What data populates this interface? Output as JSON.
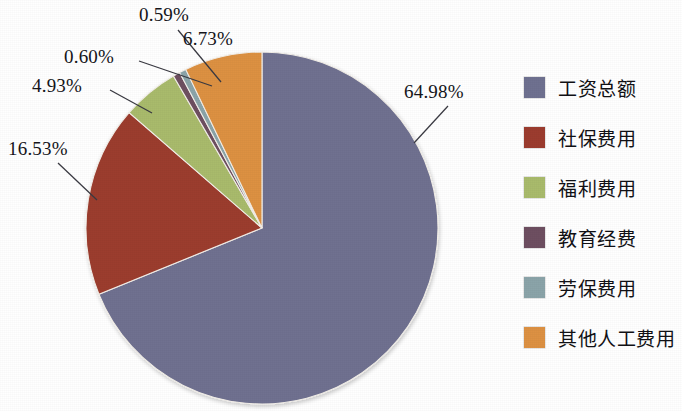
{
  "chart_data": {
    "type": "pie",
    "title": "",
    "labels": [
      "工资总额",
      "社保费用",
      "福利费用",
      "教育经费",
      "劳保费用",
      "其他人工费用"
    ],
    "values": [
      64.98,
      16.53,
      4.93,
      0.6,
      0.59,
      6.73
    ],
    "value_labels": [
      "64.98%",
      "16.53%",
      "4.93%",
      "0.60%",
      "0.59%",
      "6.73%"
    ],
    "colors": [
      "#6f7190",
      "#9c3c2f",
      "#a9bb6c",
      "#6e4f61",
      "#8ba4a9",
      "#dd9143"
    ],
    "legend_position": "right",
    "start_angle_deg": 0,
    "direction": "clockwise",
    "units": "percent",
    "grid": false
  },
  "legend": {
    "items": [
      {
        "label": "工资总额",
        "color": "#6f7190"
      },
      {
        "label": "社保费用",
        "color": "#9c3c2f"
      },
      {
        "label": "福利费用",
        "color": "#a9bb6c"
      },
      {
        "label": "教育经费",
        "color": "#6e4f61"
      },
      {
        "label": "劳保费用",
        "color": "#8ba4a9"
      },
      {
        "label": "其他人工费用",
        "color": "#dd9143"
      }
    ]
  },
  "labels": {
    "slice_0": "64.98%",
    "slice_1": "16.53%",
    "slice_2": "4.93%",
    "slice_3": "0.60%",
    "slice_4": "0.59%",
    "slice_5": "6.73%"
  }
}
